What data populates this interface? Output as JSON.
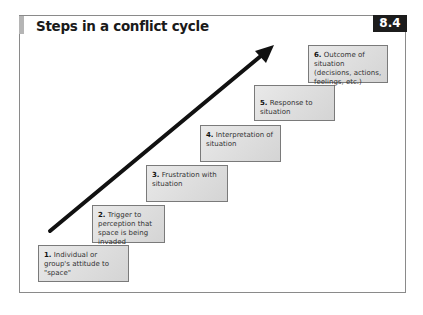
{
  "header": {
    "title": "Steps in a conflict cycle",
    "badge": "8.4"
  },
  "steps": [
    {
      "num": "1.",
      "text": "Individual or group's attitude to \"space\""
    },
    {
      "num": "2.",
      "text": "Trigger to perception that space is being invaded"
    },
    {
      "num": "3.",
      "text": "Frustration with situation"
    },
    {
      "num": "4.",
      "text": "Interpretation of situation"
    },
    {
      "num": "5.",
      "text": "Response to situation"
    },
    {
      "num": "6.",
      "text": "Outcome of situation (decisions, actions, feelings, etc.)"
    }
  ],
  "colors": {
    "badge_bg": "#1c1c1c",
    "box_fill": "#dcdcdc",
    "arrow": "#111111"
  }
}
